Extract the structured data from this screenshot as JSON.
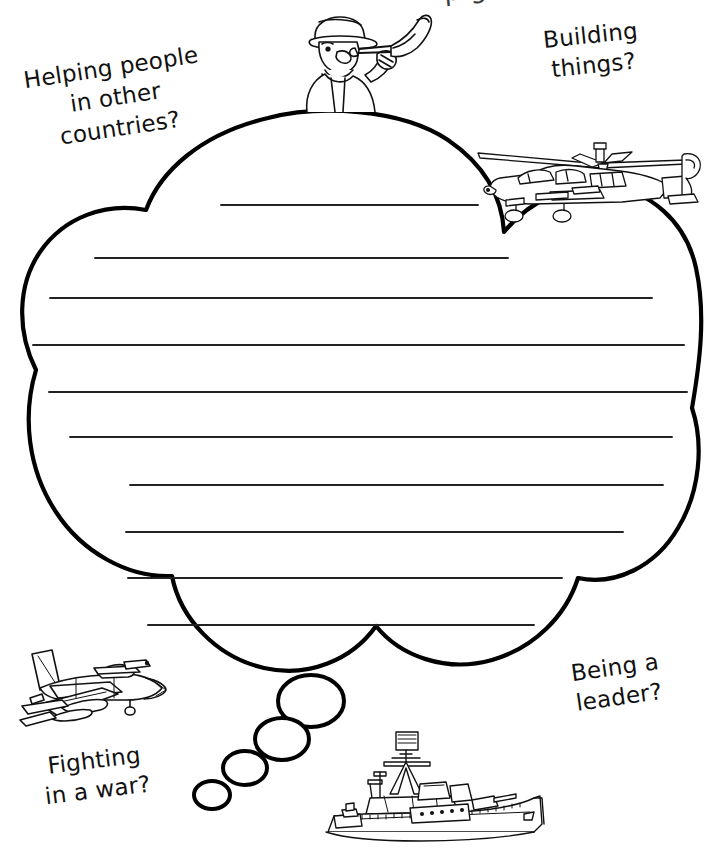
{
  "worksheet": {
    "title_partial": "p    g",
    "background_color": "#ffffff",
    "ink_color": "#000000",
    "rule_line_color": "#222222"
  },
  "prompts": [
    {
      "id": "helping-people",
      "text": "Helping people\nin other\ncountries?",
      "position": "top-left"
    },
    {
      "id": "building-things",
      "text": "Building\nthings?",
      "position": "top-right"
    },
    {
      "id": "fighting-in-a-war",
      "text": "Fighting\nin a war?",
      "position": "bottom-left"
    },
    {
      "id": "being-a-leader",
      "text": "Being a\nleader?",
      "position": "bottom-right"
    }
  ],
  "thought_bubble": {
    "shape": "cloud",
    "writing_lines_count": 10,
    "trail_bubbles_count": 4
  },
  "illustrations": [
    {
      "id": "bugler-soldier",
      "label": "soldier-playing-bugle",
      "position": "top-center"
    },
    {
      "id": "attack-helicopter",
      "label": "military-helicopter",
      "position": "upper-right"
    },
    {
      "id": "fighter-jet",
      "label": "fighter-jet-aircraft",
      "position": "lower-left"
    },
    {
      "id": "navy-destroyer",
      "label": "navy-warship",
      "position": "bottom-center"
    }
  ]
}
